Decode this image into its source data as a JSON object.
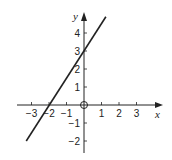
{
  "chart_data": {
    "type": "line",
    "title": "",
    "xlabel": "x",
    "ylabel": "y",
    "xlim": [
      -3.6,
      4.5
    ],
    "ylim": [
      -2.6,
      5.2
    ],
    "x_ticks": [
      -3,
      -2,
      -1,
      1,
      2,
      3
    ],
    "y_ticks": [
      -2,
      -1,
      1,
      2,
      3,
      4
    ],
    "x_tick_labels": [
      "−3",
      "−2",
      "−1",
      "1",
      "2",
      "3"
    ],
    "y_tick_labels": [
      "−2",
      "−1",
      "1",
      "2",
      "3",
      "4"
    ],
    "grid": false,
    "legend": null,
    "series": [
      {
        "name": "line",
        "equation": "y = 1.4x + 3",
        "x": [
          -3.3,
          1.25
        ],
        "y": [
          -2.0,
          4.9
        ],
        "y_intercept": 3,
        "x_intercept": -2.14
      }
    ],
    "annotations": [
      {
        "type": "open-circle",
        "x": 0,
        "y": 0
      }
    ]
  }
}
